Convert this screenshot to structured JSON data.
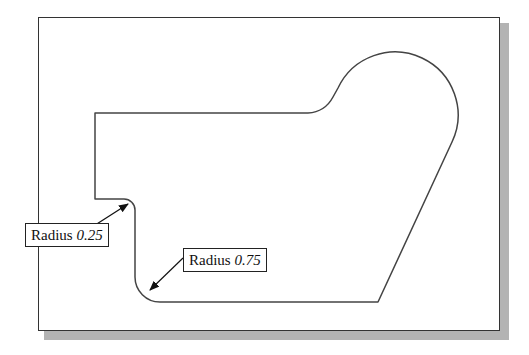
{
  "drawing": {
    "frame_color": "#333333",
    "shadow_color": "#b3b3b3",
    "outline_color": "#444444",
    "shape_path": "M95,113 L308,113 Q325,112 333,97 L338,88 A58,58 0 1 1 452,142 L378,302 L160,302 A25,25 0 0 1 135,277 L135,210 A11,11 0 0 0 124,199 L95,199 Z"
  },
  "callouts": [
    {
      "id": "radius-small",
      "label_prefix": "Radius ",
      "value": "0.25",
      "arrow": {
        "x1": 78,
        "y1": 236,
        "x2": 128,
        "y2": 204
      }
    },
    {
      "id": "radius-large",
      "label_prefix": "Radius ",
      "value": "0.75",
      "arrow": {
        "x1": 183,
        "y1": 258,
        "x2": 150,
        "y2": 290
      }
    }
  ]
}
